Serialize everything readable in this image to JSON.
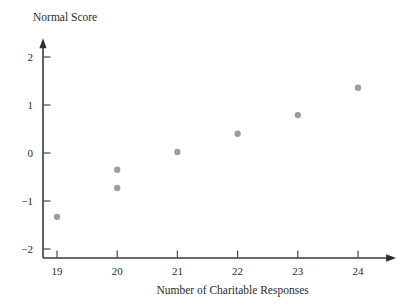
{
  "chart_data": {
    "type": "scatter",
    "title": "",
    "xlabel": "Number of Charitable Responses",
    "ylabel": "Normal Score",
    "x": [
      19,
      20,
      20,
      21,
      22,
      23,
      24
    ],
    "y": [
      -1.33,
      -0.35,
      -0.73,
      0.02,
      0.4,
      0.79,
      1.36
    ],
    "points": [
      {
        "x": 19,
        "y": -1.33
      },
      {
        "x": 20,
        "y": -0.35
      },
      {
        "x": 20,
        "y": -0.73
      },
      {
        "x": 21,
        "y": 0.02
      },
      {
        "x": 22,
        "y": 0.4
      },
      {
        "x": 23,
        "y": 0.79
      },
      {
        "x": 24,
        "y": 1.36
      }
    ],
    "xlim": [
      18.55,
      24.6
    ],
    "ylim": [
      -2.32,
      2.35
    ],
    "xticks": [
      19,
      20,
      21,
      22,
      23,
      24
    ],
    "xtick_labels": [
      "19",
      "20",
      "21",
      "22",
      "23",
      "24"
    ],
    "yticks": [
      -2,
      -1,
      0,
      1,
      2
    ],
    "ytick_labels": [
      "−2",
      "−1",
      "0",
      "1",
      "2"
    ],
    "grid": false,
    "legend": null,
    "marker_color": "#9d9d9d",
    "axis_color": "#3a3a3a",
    "marker_size": 3.2,
    "x_axis_has_arrow": true,
    "y_axis_has_arrow": true
  }
}
